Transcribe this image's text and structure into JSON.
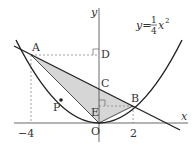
{
  "diagram": {
    "equation": {
      "lhs": "y=",
      "num": "1",
      "den": "4",
      "var": "x",
      "exp": "2"
    },
    "axes": {
      "x_label": "x",
      "y_label": "y",
      "origin": "O"
    },
    "ticks": {
      "x_neg4": "−4",
      "x_2": "2"
    },
    "points": {
      "A": "A",
      "B": "B",
      "C": "C",
      "D": "D",
      "E": "E",
      "P": "P"
    },
    "colors": {
      "shade": "#d6d6d6",
      "line": "#222222",
      "dashed": "#888888"
    }
  }
}
